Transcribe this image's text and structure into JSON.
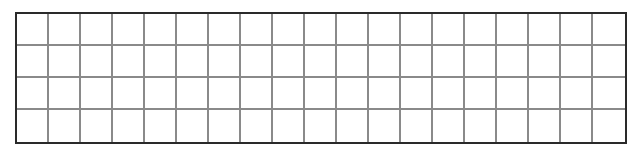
{
  "grid": {
    "rows": 4,
    "columns": 19,
    "cells": [
      [
        "",
        "",
        "",
        "",
        "",
        "",
        "",
        "",
        "",
        "",
        "",
        "",
        "",
        "",
        "",
        "",
        "",
        "",
        ""
      ],
      [
        "",
        "",
        "",
        "",
        "",
        "",
        "",
        "",
        "",
        "",
        "",
        "",
        "",
        "",
        "",
        "",
        "",
        "",
        ""
      ],
      [
        "",
        "",
        "",
        "",
        "",
        "",
        "",
        "",
        "",
        "",
        "",
        "",
        "",
        "",
        "",
        "",
        "",
        "",
        ""
      ],
      [
        "",
        "",
        "",
        "",
        "",
        "",
        "",
        "",
        "",
        "",
        "",
        "",
        "",
        "",
        "",
        "",
        "",
        "",
        ""
      ]
    ],
    "colors": {
      "outer_border": "#2a2a2a",
      "inner_lines": "#8a8a8a",
      "cell_background": "#ffffff"
    }
  }
}
